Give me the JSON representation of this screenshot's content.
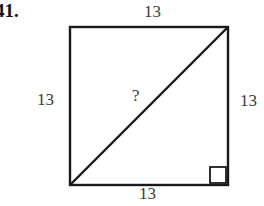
{
  "figure": {
    "problem_number": "41.",
    "shape_name": "square",
    "background_color": "#ffffff",
    "stroke_color": "#1a1a1a",
    "text_color": "#3a3a3a",
    "labels": {
      "top": "13",
      "left": "13",
      "right": "13",
      "bottom": "13",
      "diagonal": "?"
    },
    "geometry": {
      "square": {
        "x": 70,
        "y": 27,
        "width": 158,
        "height": 158
      },
      "diagonal": {
        "x1": 70,
        "y1": 185,
        "x2": 228,
        "y2": 27
      },
      "right_angle_marker": {
        "x": 210,
        "y": 167,
        "size": 16,
        "corner": "bottom-right"
      },
      "stroke_width": 2.4
    }
  }
}
